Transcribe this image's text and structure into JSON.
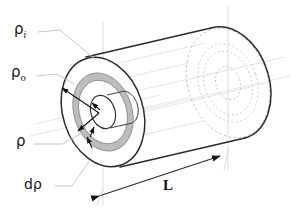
{
  "figure": {
    "background": "#ffffff",
    "colors": {
      "outline": "#2b2b2b",
      "construction": "#c9c9c9",
      "hidden": "#b0b0b0",
      "shell_fill": "#bdbdbd",
      "shell_stroke": "#9a9a9a",
      "leader": "#bdbdbd",
      "text": "#1a1a1a",
      "centerline": "#d0d0d0"
    }
  },
  "labels": {
    "inner_radius": {
      "symbol": "ρ",
      "subscript": "i",
      "name": "inner radius"
    },
    "outer_radius": {
      "symbol": "ρ",
      "subscript": "o",
      "name": "outer radius"
    },
    "shell_radius": {
      "symbol": "ρ",
      "subscript": "",
      "name": "shell radius"
    },
    "shell_thickness": {
      "text": "dρ",
      "name": "differential thickness"
    },
    "length": {
      "text": "L",
      "name": "cylinder length"
    }
  },
  "geometry": {
    "front_face": {
      "cx": 103,
      "cy": 112,
      "rx": 40,
      "ry": 56,
      "rotation": -18
    },
    "back_face": {
      "cx": 228,
      "cy": 83,
      "rx": 40,
      "ry": 56,
      "rotation": -18
    },
    "rings": [
      {
        "name": "outer",
        "scale": 1.0,
        "style": "solid"
      },
      {
        "name": "shell-outer",
        "scale": 0.72,
        "style": "shaded"
      },
      {
        "name": "shell-inner",
        "scale": 0.58,
        "style": "shaded"
      },
      {
        "name": "inner-bore",
        "scale": 0.3,
        "style": "solid"
      }
    ],
    "dimension_line": {
      "x1": 97,
      "y1": 196,
      "x2": 222,
      "y2": 155,
      "arrows": "both"
    }
  }
}
